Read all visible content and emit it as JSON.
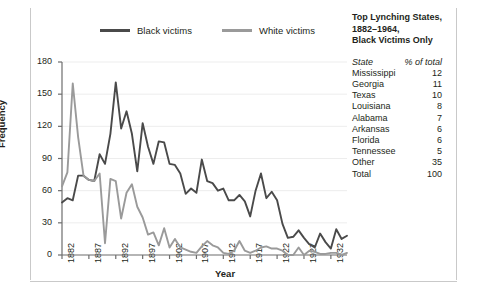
{
  "legend": {
    "items": [
      {
        "label": "Black victims",
        "color": "#4a4a4a"
      },
      {
        "label": "White victims",
        "color": "#9a9a9a"
      }
    ]
  },
  "side_panel": {
    "title": "Top Lynching States, 1882–1964, Black Victims Only",
    "title_line1": "Top Lynching States,",
    "title_line2": "1882–1964,",
    "title_line3": "Black Victims Only",
    "columns": [
      "State",
      "% of total"
    ],
    "rows": [
      {
        "state": "Mississippi",
        "pct": "12"
      },
      {
        "state": "Georgia",
        "pct": "11"
      },
      {
        "state": "Texas",
        "pct": "10"
      },
      {
        "state": "Louisiana",
        "pct": "8"
      },
      {
        "state": "Alabama",
        "pct": "7"
      },
      {
        "state": "Arkansas",
        "pct": "6"
      },
      {
        "state": "Florida",
        "pct": "6"
      },
      {
        "state": "Tennessee",
        "pct": "5"
      },
      {
        "state": "Other",
        "pct": "35"
      },
      {
        "state": "Total",
        "pct": "100"
      }
    ]
  },
  "chart_data": {
    "type": "line",
    "title": "",
    "xlabel": "Year",
    "ylabel": "Frequency",
    "xlim": [
      1882,
      1935
    ],
    "ylim": [
      0,
      180
    ],
    "yticks": [
      0,
      30,
      60,
      90,
      120,
      150,
      180
    ],
    "xticks": [
      1882,
      1887,
      1892,
      1897,
      1902,
      1907,
      1912,
      1917,
      1922,
      1927,
      1932
    ],
    "grid": true,
    "legend_position": "top",
    "x": [
      1882,
      1883,
      1884,
      1885,
      1886,
      1887,
      1888,
      1889,
      1890,
      1891,
      1892,
      1893,
      1894,
      1895,
      1896,
      1897,
      1898,
      1899,
      1900,
      1901,
      1902,
      1903,
      1904,
      1905,
      1906,
      1907,
      1908,
      1909,
      1910,
      1911,
      1912,
      1913,
      1914,
      1915,
      1916,
      1917,
      1918,
      1919,
      1920,
      1921,
      1922,
      1923,
      1924,
      1925,
      1926,
      1927,
      1928,
      1929,
      1930,
      1931,
      1932,
      1933,
      1934,
      1935
    ],
    "series": [
      {
        "name": "Black victims",
        "color": "#4a4a4a",
        "values": [
          49,
          53,
          51,
          74,
          74,
          70,
          69,
          94,
          85,
          113,
          161,
          118,
          134,
          113,
          78,
          123,
          101,
          85,
          106,
          105,
          85,
          84,
          76,
          57,
          62,
          58,
          89,
          69,
          67,
          60,
          62,
          51,
          51,
          56,
          50,
          36,
          60,
          76,
          53,
          59,
          51,
          29,
          16,
          17,
          23,
          16,
          10,
          7,
          20,
          12,
          6,
          24,
          15,
          18
        ]
      },
      {
        "name": "White victims",
        "color": "#9a9a9a",
        "values": [
          64,
          77,
          160,
          110,
          74,
          70,
          69,
          76,
          11,
          71,
          69,
          34,
          58,
          66,
          45,
          35,
          19,
          21,
          9,
          25,
          7,
          15,
          7,
          5,
          3,
          2,
          8,
          13,
          9,
          7,
          2,
          1,
          4,
          13,
          4,
          2,
          4,
          7,
          8,
          6,
          6,
          4,
          0,
          0,
          7,
          0,
          4,
          3,
          1,
          1,
          2,
          2,
          0,
          2
        ]
      }
    ]
  }
}
